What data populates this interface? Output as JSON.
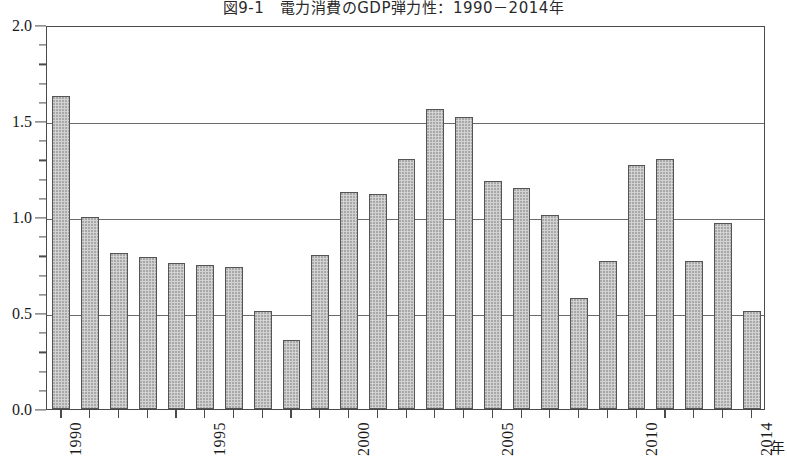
{
  "chart_data": {
    "type": "bar",
    "title": "図9-1　電力消費のGDP弾力性：1990－2014年",
    "xlabel": "年",
    "ylabel": "",
    "ylim": [
      0.0,
      2.0
    ],
    "y_major_step": 0.5,
    "y_minor_step": 0.1,
    "grid": "horizontal-major",
    "legend": "none",
    "y_ticklabels": [
      "2.0",
      "1.5",
      "1.0",
      "0.5",
      "0.0"
    ],
    "x_ticklabels": [
      "1990",
      "1995",
      "2000",
      "2005",
      "2010",
      "2014"
    ],
    "categories": [
      "1990",
      "1991",
      "1992",
      "1993",
      "1994",
      "1995",
      "1996",
      "1997",
      "1998",
      "1999",
      "2000",
      "2001",
      "2002",
      "2003",
      "2004",
      "2005",
      "2006",
      "2007",
      "2008",
      "2009",
      "2010",
      "2011",
      "2012",
      "2013",
      "2014"
    ],
    "values": [
      1.63,
      1.0,
      0.81,
      0.79,
      0.76,
      0.75,
      0.74,
      0.51,
      0.36,
      0.8,
      1.13,
      1.12,
      1.3,
      1.56,
      1.52,
      1.19,
      1.15,
      1.01,
      0.58,
      0.77,
      1.27,
      1.3,
      0.77,
      0.97,
      0.51
    ],
    "bar_fill_color": "#d2d2d2",
    "bar_edge_color": "#555555",
    "axis_color": "#4a4a4a",
    "gridline_color": "#6b6b6b"
  }
}
